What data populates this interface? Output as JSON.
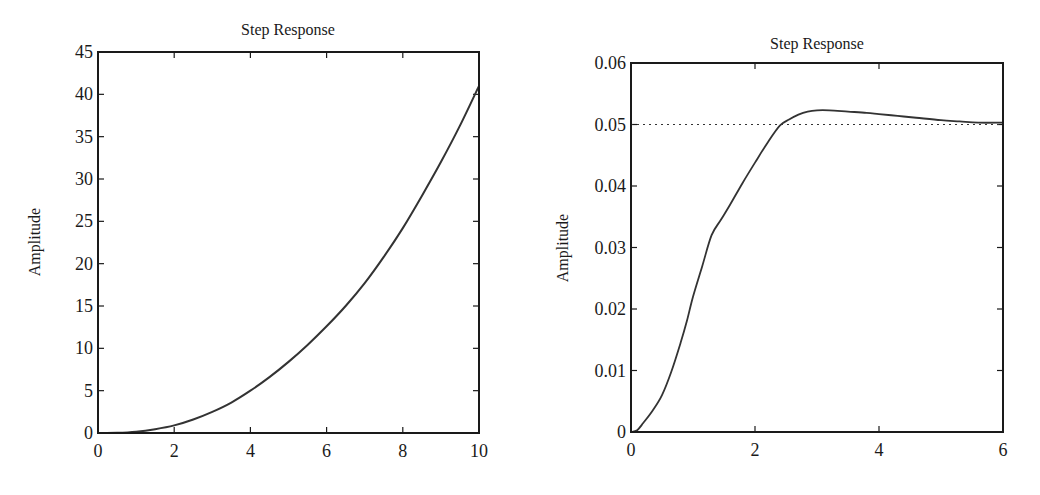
{
  "chart_data": [
    {
      "type": "line",
      "title": "Step Response",
      "xlabel": "",
      "ylabel": "Amplitude",
      "xlim": [
        0,
        10
      ],
      "ylim": [
        0,
        45
      ],
      "xticks": [
        0,
        2,
        4,
        6,
        8,
        10
      ],
      "yticks": [
        0,
        5,
        10,
        15,
        20,
        25,
        30,
        35,
        40,
        45
      ],
      "grid": false,
      "legend": null,
      "series": [
        {
          "name": "step response",
          "x": [
            0,
            0.5,
            1,
            1.5,
            2,
            2.5,
            3,
            3.5,
            4,
            4.5,
            5,
            5.5,
            6,
            6.5,
            7,
            7.5,
            8,
            8.5,
            9,
            9.5,
            10
          ],
          "y": [
            0,
            0.02,
            0.15,
            0.45,
            0.9,
            1.6,
            2.5,
            3.6,
            5.0,
            6.6,
            8.4,
            10.4,
            12.6,
            15.0,
            17.7,
            20.8,
            24.2,
            28.0,
            32.0,
            36.3,
            41.0
          ]
        }
      ]
    },
    {
      "type": "line",
      "title": "Step Response",
      "xlabel": "",
      "ylabel": "Amplitude",
      "xlim": [
        0,
        6
      ],
      "ylim": [
        0,
        0.06
      ],
      "xticks": [
        0,
        2,
        4,
        6
      ],
      "yticks": [
        0,
        0.01,
        0.02,
        0.03,
        0.04,
        0.05,
        0.06
      ],
      "ytick_labels": [
        "0",
        "0.01",
        "0.02",
        "0.03",
        "0.04",
        "0.05",
        "0.06"
      ],
      "grid": false,
      "legend": null,
      "reference_line": {
        "y": 0.05,
        "style": "dotted",
        "label": "steady-state value"
      },
      "series": [
        {
          "name": "step response",
          "x": [
            0,
            0.1,
            0.2,
            0.35,
            0.5,
            0.65,
            0.8,
            0.9,
            1.0,
            1.15,
            1.3,
            1.45,
            1.6,
            1.8,
            2.0,
            2.2,
            2.4,
            2.55,
            2.7,
            2.85,
            3.0,
            3.2,
            3.5,
            3.8,
            4.0,
            4.3,
            4.6,
            5.0,
            5.3,
            5.6,
            6.0
          ],
          "y": [
            0,
            0.0003,
            0.0015,
            0.0035,
            0.006,
            0.0098,
            0.0145,
            0.018,
            0.022,
            0.027,
            0.032,
            0.0345,
            0.037,
            0.0405,
            0.0438,
            0.047,
            0.0498,
            0.0508,
            0.0516,
            0.0521,
            0.0523,
            0.0523,
            0.0521,
            0.0519,
            0.0517,
            0.0514,
            0.0511,
            0.0507,
            0.0505,
            0.0503,
            0.0503
          ]
        }
      ]
    }
  ],
  "charts": [
    {
      "title": "Step Response",
      "ylabel": "Amplitude",
      "xtick_labels": [
        "0",
        "2",
        "4",
        "6",
        "8",
        "10"
      ],
      "ytick_labels": [
        "0",
        "5",
        "10",
        "15",
        "20",
        "25",
        "30",
        "35",
        "40",
        "45"
      ]
    },
    {
      "title": "Step Response",
      "ylabel": "Amplitude",
      "xtick_labels": [
        "0",
        "2",
        "4",
        "6"
      ],
      "ytick_labels": [
        "0",
        "0.01",
        "0.02",
        "0.03",
        "0.04",
        "0.05",
        "0.06"
      ]
    }
  ],
  "colors": {
    "axes": "#1a1a1a",
    "line": "#333333",
    "reference_line": "#333333",
    "background": "#ffffff"
  }
}
